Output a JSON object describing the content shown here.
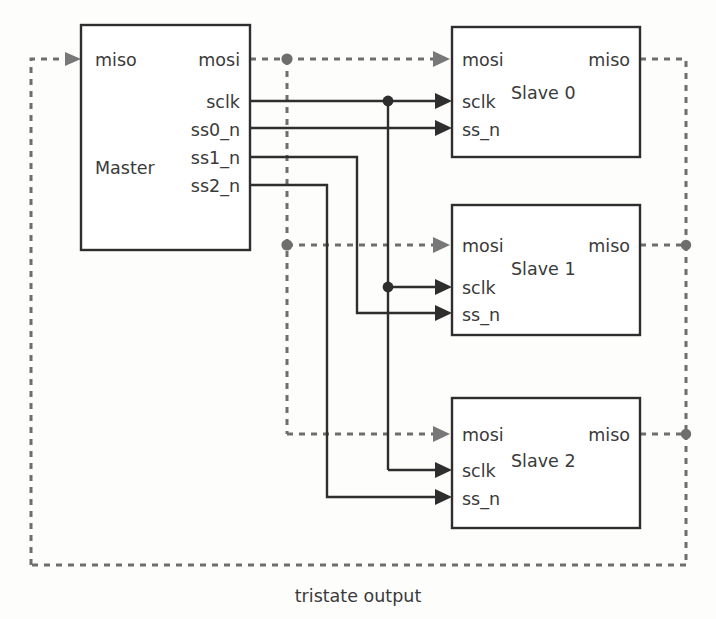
{
  "diagram": {
    "caption": "tristate output",
    "colors": {
      "solid_wire": "#2e2e2e",
      "dotted_wire": "#6e6e6e",
      "block_border": "#2e2e2e",
      "text": "#3a3a3a",
      "background": "#fdfdfc"
    },
    "blocks": [
      {
        "id": "master",
        "name": "Master",
        "left_pins": [
          "miso"
        ],
        "right_pins": [
          "mosi",
          "sclk",
          "ss0_n",
          "ss1_n",
          "ss2_n"
        ]
      },
      {
        "id": "slave0",
        "name": "Slave 0",
        "left_pins": [
          "mosi",
          "sclk",
          "ss_n"
        ],
        "right_pins": [
          "miso"
        ]
      },
      {
        "id": "slave1",
        "name": "Slave 1",
        "left_pins": [
          "mosi",
          "sclk",
          "ss_n"
        ],
        "right_pins": [
          "miso"
        ]
      },
      {
        "id": "slave2",
        "name": "Slave 2",
        "left_pins": [
          "mosi",
          "sclk",
          "ss_n"
        ],
        "right_pins": [
          "miso"
        ]
      }
    ],
    "labels": {
      "master_name": "Master",
      "master_miso": "miso",
      "master_mosi": "mosi",
      "master_sclk": "sclk",
      "master_ss0_n": "ss0_n",
      "master_ss1_n": "ss1_n",
      "master_ss2_n": "ss2_n",
      "slave0_name": "Slave 0",
      "slave0_mosi": "mosi",
      "slave0_miso": "miso",
      "slave0_sclk": "sclk",
      "slave0_ss_n": "ss_n",
      "slave1_name": "Slave 1",
      "slave1_mosi": "mosi",
      "slave1_miso": "miso",
      "slave1_sclk": "sclk",
      "slave1_ss_n": "ss_n",
      "slave2_name": "Slave 2",
      "slave2_mosi": "mosi",
      "slave2_miso": "miso",
      "slave2_sclk": "sclk",
      "slave2_ss_n": "ss_n",
      "caption": "tristate output"
    },
    "nets": [
      {
        "name": "mosi",
        "style": "dotted",
        "from": "master.mosi",
        "to": [
          "slave0.mosi",
          "slave1.mosi",
          "slave2.mosi"
        ]
      },
      {
        "name": "miso",
        "style": "dotted",
        "from": [
          "slave0.miso",
          "slave1.miso",
          "slave2.miso"
        ],
        "to": "master.miso"
      },
      {
        "name": "sclk",
        "style": "solid",
        "from": "master.sclk",
        "to": [
          "slave0.sclk",
          "slave1.sclk",
          "slave2.sclk"
        ]
      },
      {
        "name": "ss0_n",
        "style": "solid",
        "from": "master.ss0_n",
        "to": [
          "slave0.ss_n"
        ]
      },
      {
        "name": "ss1_n",
        "style": "solid",
        "from": "master.ss1_n",
        "to": [
          "slave1.ss_n"
        ]
      },
      {
        "name": "ss2_n",
        "style": "solid",
        "from": "master.ss2_n",
        "to": [
          "slave2.ss_n"
        ]
      }
    ]
  }
}
